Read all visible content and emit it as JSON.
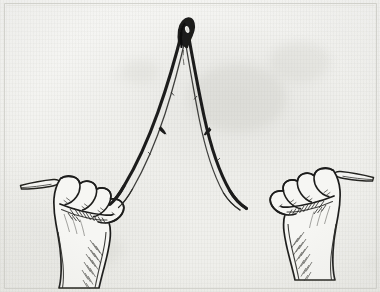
{
  "image": {
    "kind": "scanned-engraving",
    "subject": "two-fists-holding-forked-dowsing-rod",
    "medium": "pen-and-ink line drawing",
    "caption": "Two clenched fists gripping the two ends of a forked hazel twig (divining rod) held in an inverted V with the fork tip pointing upward.",
    "width_px": 380,
    "height_px": 292
  },
  "colors": {
    "paper": "#f3f3f0",
    "paper_highlight": "#f8f8f6",
    "paper_shadow": "#e8e8e3",
    "ink": "#1d1d1c",
    "ink_mid": "#4a4a47",
    "ink_light": "#8a8a85",
    "border": "#cfcfc9",
    "stain": "#c9c9c2"
  },
  "frame": {
    "name": "plate-border",
    "inset_px": 4,
    "stroke": "#cfcfc9",
    "visible": true
  },
  "objects": {
    "rod": {
      "label": "forked-divining-rod",
      "description": "Y-shaped hazel twig bent into an inverted V; apex at top center, two limbs sweeping down and outward to each fist.",
      "apex": {
        "x": 185,
        "y": 24,
        "note": "dark hooked tip with small pale eye/knot"
      },
      "left_limb_end": {
        "x": 118,
        "y": 206
      },
      "right_limb_end": {
        "x": 252,
        "y": 200
      },
      "nodes": [
        {
          "x": 164,
          "y": 131,
          "label": "twig-scar-left"
        },
        {
          "x": 206,
          "y": 132,
          "label": "twig-scar-right"
        }
      ],
      "stub_left": {
        "x": 22,
        "y": 184,
        "label": "rod-stub-left"
      },
      "stub_right": {
        "x": 357,
        "y": 174,
        "label": "rod-stub-right"
      }
    },
    "left_hand": {
      "label": "left-fist",
      "description": "Clenched fist, knuckles up, thumb folded over fingers, wrist descending to lower left; short rod stub protrudes to the left.",
      "center": {
        "x": 78,
        "y": 212
      }
    },
    "right_hand": {
      "label": "right-fist",
      "description": "Mirror-image clenched fist, knuckles up, thumb folded over fingers, wrist descending to lower right; short rod stub protrudes to the right.",
      "center": {
        "x": 300,
        "y": 205
      }
    }
  },
  "annotations": {
    "text_present": false,
    "labels": []
  }
}
